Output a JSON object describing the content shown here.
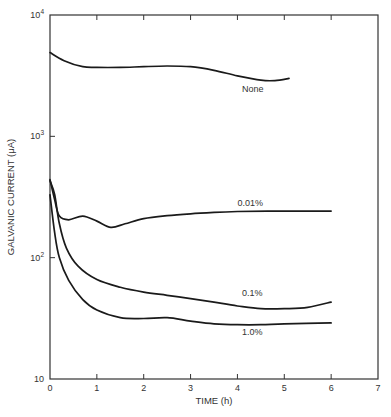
{
  "chart_data": {
    "type": "line",
    "title": "",
    "xlabel": "TIME (h)",
    "ylabel": "GALVANIC CURRENT (μA)",
    "xlim": [
      0,
      7
    ],
    "ylim": [
      10,
      10000
    ],
    "yscale": "log",
    "grid": false,
    "legend": "inline labels",
    "x_ticks": [
      "0",
      "1",
      "2",
      "3",
      "4",
      "5",
      "6",
      "7"
    ],
    "y_ticks": [
      {
        "value": 10,
        "base": "10",
        "exp": ""
      },
      {
        "value": 100,
        "base": "10",
        "exp": "2"
      },
      {
        "value": 1000,
        "base": "10",
        "exp": "3"
      },
      {
        "value": 10000,
        "base": "10",
        "exp": "4"
      }
    ],
    "series": [
      {
        "name": "None",
        "label_pos": {
          "x": 4.1,
          "y": 2300
        },
        "points": [
          [
            0,
            4900
          ],
          [
            0.3,
            4200
          ],
          [
            0.7,
            3750
          ],
          [
            1.0,
            3700
          ],
          [
            1.5,
            3700
          ],
          [
            2.0,
            3750
          ],
          [
            2.5,
            3800
          ],
          [
            3.0,
            3750
          ],
          [
            3.5,
            3500
          ],
          [
            4.0,
            3150
          ],
          [
            4.5,
            2900
          ],
          [
            4.8,
            2880
          ],
          [
            5.1,
            3000
          ]
        ]
      },
      {
        "name": "0.01%",
        "label_pos": {
          "x": 4.0,
          "y": 265
        },
        "points": [
          [
            0,
            440
          ],
          [
            0.1,
            300
          ],
          [
            0.2,
            220
          ],
          [
            0.4,
            205
          ],
          [
            0.7,
            220
          ],
          [
            1.0,
            200
          ],
          [
            1.3,
            178
          ],
          [
            1.6,
            190
          ],
          [
            2.0,
            210
          ],
          [
            2.5,
            222
          ],
          [
            3.0,
            230
          ],
          [
            3.5,
            236
          ],
          [
            4.0,
            240
          ],
          [
            5.0,
            242
          ],
          [
            6.0,
            242
          ]
        ]
      },
      {
        "name": "0.1%",
        "label_pos": {
          "x": 4.1,
          "y": 48
        },
        "points": [
          [
            0,
            430
          ],
          [
            0.1,
            330
          ],
          [
            0.2,
            190
          ],
          [
            0.35,
            120
          ],
          [
            0.6,
            85
          ],
          [
            1.0,
            66
          ],
          [
            1.5,
            57
          ],
          [
            2.0,
            52
          ],
          [
            2.5,
            49
          ],
          [
            3.0,
            46
          ],
          [
            3.5,
            43
          ],
          [
            4.0,
            40
          ],
          [
            4.5,
            38
          ],
          [
            5.0,
            38
          ],
          [
            5.5,
            39
          ],
          [
            6.0,
            43
          ]
        ]
      },
      {
        "name": "1.0%",
        "label_pos": {
          "x": 4.1,
          "y": 23
        },
        "points": [
          [
            0,
            330
          ],
          [
            0.1,
            160
          ],
          [
            0.2,
            100
          ],
          [
            0.4,
            65
          ],
          [
            0.7,
            45
          ],
          [
            1.0,
            37
          ],
          [
            1.5,
            32
          ],
          [
            2.0,
            31.5
          ],
          [
            2.5,
            32
          ],
          [
            3.0,
            30
          ],
          [
            3.5,
            28.5
          ],
          [
            4.0,
            28
          ],
          [
            4.5,
            28
          ],
          [
            5.0,
            28.5
          ],
          [
            6.0,
            29
          ]
        ]
      }
    ]
  },
  "colors": {
    "line": "#1a1a1a",
    "axis": "#333333",
    "text": "#333333"
  }
}
